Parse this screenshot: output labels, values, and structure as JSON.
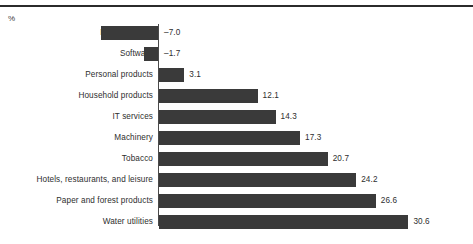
{
  "unit_label": "%",
  "style": {
    "bar_color": "#3a3a3a",
    "axis_color": "#4a4a4a",
    "rule_color": "#2b2b2b",
    "text_color": "#2e2e2e",
    "background": "#ffffff"
  },
  "geometry": {
    "zero_x": 158,
    "px_per_unit": 8.15,
    "first_row_top": 26,
    "row_pitch": 21,
    "bar_height": 14,
    "label_gap": 5
  },
  "chart_data": {
    "type": "bar",
    "orientation": "horizontal",
    "title": "",
    "subtitle": "",
    "xlabel": "%",
    "ylabel": "",
    "grid": false,
    "legend": false,
    "xlim": [
      -7.0,
      30.6
    ],
    "zero_line": 0,
    "value_labels": true,
    "categories": [
      "Biotechnology",
      "Software",
      "Personal products",
      "Household products",
      "IT services",
      "Machinery",
      "Tobacco",
      "Hotels, restaurants, and leisure",
      "Paper and forest products",
      "Water utilities"
    ],
    "values": [
      -7.0,
      -1.7,
      3.1,
      12.1,
      14.3,
      17.3,
      20.7,
      24.2,
      26.6,
      30.6
    ],
    "labels": [
      "–7.0",
      "–1.7",
      "3.1",
      "12.1",
      "14.3",
      "17.3",
      "20.7",
      "24.2",
      "26.6",
      "30.6"
    ]
  }
}
